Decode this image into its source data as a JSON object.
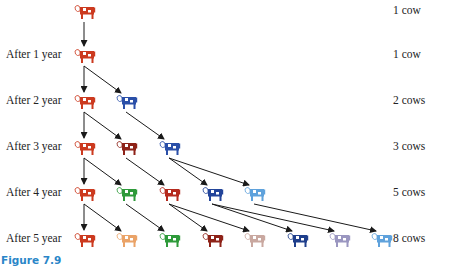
{
  "figure": {
    "caption": "Figure 7.9",
    "rows": [
      {
        "label": "",
        "count_label": "1 cow",
        "y": 12,
        "cows": [
          {
            "x": 85,
            "color": "#cc3a1f"
          }
        ]
      },
      {
        "label": "After 1 year",
        "count_label": "1 cow",
        "y": 56,
        "cows": [
          {
            "x": 85,
            "color": "#cc3a1f"
          }
        ]
      },
      {
        "label": "After 2 year",
        "count_label": "2 cows",
        "y": 102,
        "cows": [
          {
            "x": 85,
            "color": "#cc3a1f"
          },
          {
            "x": 127,
            "color": "#2a4fa8"
          }
        ]
      },
      {
        "label": "After 3 year",
        "count_label": "3 cows",
        "y": 148,
        "cows": [
          {
            "x": 85,
            "color": "#cc3a1f"
          },
          {
            "x": 127,
            "color": "#8e2218"
          },
          {
            "x": 170,
            "color": "#2a4fa8"
          }
        ]
      },
      {
        "label": "After 4 year",
        "count_label": "5 cows",
        "y": 194,
        "cows": [
          {
            "x": 85,
            "color": "#cc3a1f"
          },
          {
            "x": 127,
            "color": "#2e9a3a"
          },
          {
            "x": 170,
            "color": "#b52a1e"
          },
          {
            "x": 213,
            "color": "#23459a"
          },
          {
            "x": 255,
            "color": "#5fa2dc"
          }
        ]
      },
      {
        "label": "After 5 year",
        "count_label": "8 cows",
        "y": 240,
        "cows": [
          {
            "x": 85,
            "color": "#cc3a1f"
          },
          {
            "x": 127,
            "color": "#eaa368"
          },
          {
            "x": 170,
            "color": "#2e9a3a"
          },
          {
            "x": 213,
            "color": "#8e2218"
          },
          {
            "x": 255,
            "color": "#c9a8a0"
          },
          {
            "x": 298,
            "color": "#1f3f8c"
          },
          {
            "x": 340,
            "color": "#9a96c0"
          },
          {
            "x": 382,
            "color": "#5fa2dc"
          }
        ]
      }
    ],
    "edges": [
      {
        "from": [
          0,
          0
        ],
        "to": [
          1,
          0
        ]
      },
      {
        "from": [
          1,
          0
        ],
        "to": [
          2,
          0
        ]
      },
      {
        "from": [
          1,
          0
        ],
        "to": [
          2,
          1
        ]
      },
      {
        "from": [
          2,
          0
        ],
        "to": [
          3,
          0
        ]
      },
      {
        "from": [
          2,
          0
        ],
        "to": [
          3,
          1
        ]
      },
      {
        "from": [
          2,
          1
        ],
        "to": [
          3,
          2
        ]
      },
      {
        "from": [
          3,
          0
        ],
        "to": [
          4,
          0
        ]
      },
      {
        "from": [
          3,
          0
        ],
        "to": [
          4,
          1
        ]
      },
      {
        "from": [
          3,
          1
        ],
        "to": [
          4,
          2
        ]
      },
      {
        "from": [
          3,
          2
        ],
        "to": [
          4,
          3
        ]
      },
      {
        "from": [
          3,
          2
        ],
        "to": [
          4,
          4
        ]
      },
      {
        "from": [
          4,
          0
        ],
        "to": [
          5,
          0
        ]
      },
      {
        "from": [
          4,
          0
        ],
        "to": [
          5,
          1
        ]
      },
      {
        "from": [
          4,
          1
        ],
        "to": [
          5,
          2
        ]
      },
      {
        "from": [
          4,
          2
        ],
        "to": [
          5,
          3
        ]
      },
      {
        "from": [
          4,
          2
        ],
        "to": [
          5,
          4
        ]
      },
      {
        "from": [
          4,
          3
        ],
        "to": [
          5,
          5
        ]
      },
      {
        "from": [
          4,
          3
        ],
        "to": [
          5,
          6
        ]
      },
      {
        "from": [
          4,
          4
        ],
        "to": [
          5,
          7
        ]
      }
    ]
  }
}
